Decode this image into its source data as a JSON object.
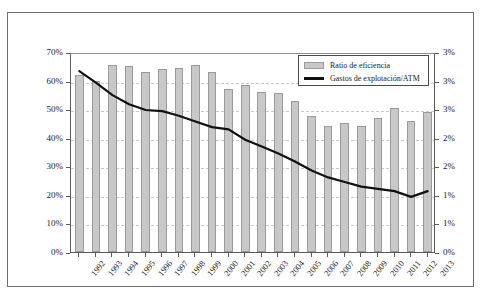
{
  "chart_data": {
    "type": "bar",
    "title": "",
    "subtitle": "",
    "xlabel": "",
    "ylabel": "",
    "grid": true,
    "legend_position": "top-right",
    "categories": [
      "1992",
      "1993",
      "1994",
      "1995",
      "1996",
      "1997",
      "1998",
      "1999",
      "2000",
      "2001",
      "2002",
      "2003",
      "2004",
      "2005",
      "2006",
      "2007",
      "2008",
      "2009",
      "2010",
      "2011",
      "2012",
      "2013"
    ],
    "axes": {
      "left": {
        "name": "Ratio de eficiencia",
        "ylim": [
          0,
          70
        ],
        "tick_values": [
          0,
          10,
          20,
          30,
          40,
          50,
          60,
          70
        ],
        "tick_labels": [
          "0%",
          "10%",
          "20%",
          "30%",
          "40%",
          "50%",
          "60%",
          "70%"
        ],
        "unit": "%"
      },
      "right": {
        "name": "Gastos de explotación/ATM",
        "ylim": [
          0,
          3.5
        ],
        "tick_values": [
          0,
          0.5,
          1.0,
          1.5,
          2.0,
          2.5,
          3.0,
          3.5
        ],
        "tick_labels": [
          "0%",
          "1%",
          "1%",
          "2%",
          "2%",
          "3%",
          "3%"
        ],
        "unit": "%"
      }
    },
    "series": [
      {
        "name": "Ratio de eficiencia",
        "type": "bar",
        "axis": "left",
        "color": "#c8c8c8",
        "edge_color": "#9a9a9a",
        "values": [
          62.0,
          60.0,
          65.5,
          65.0,
          63.0,
          64.0,
          64.5,
          65.5,
          63.0,
          57.0,
          58.5,
          56.0,
          55.5,
          53.0,
          47.5,
          44.0,
          45.0,
          44.0,
          47.0,
          50.5,
          46.0,
          49.0
        ]
      },
      {
        "name": "Gastos de explotación/ATM",
        "type": "line",
        "axis": "right",
        "color": "#111111",
        "values": [
          3.2,
          3.0,
          2.78,
          2.62,
          2.52,
          2.5,
          2.42,
          2.32,
          2.22,
          2.18,
          2.0,
          1.88,
          1.76,
          1.62,
          1.46,
          1.34,
          1.26,
          1.18,
          1.14,
          1.1,
          1.0,
          1.1
        ]
      }
    ],
    "legend": [
      {
        "label": "Ratio de eficiencia",
        "marker": "bar-swatch"
      },
      {
        "label": "Gastos de explotación/ATM",
        "marker": "line-swatch"
      }
    ]
  },
  "colors": {
    "bar_fill": "#c8c8c8",
    "bar_edge": "#9a9a9a",
    "line": "#111111",
    "grid": "#c9c9c9",
    "axis": "#5a5a5a",
    "frame": "#6e6e6e",
    "background": "#ffffff"
  }
}
